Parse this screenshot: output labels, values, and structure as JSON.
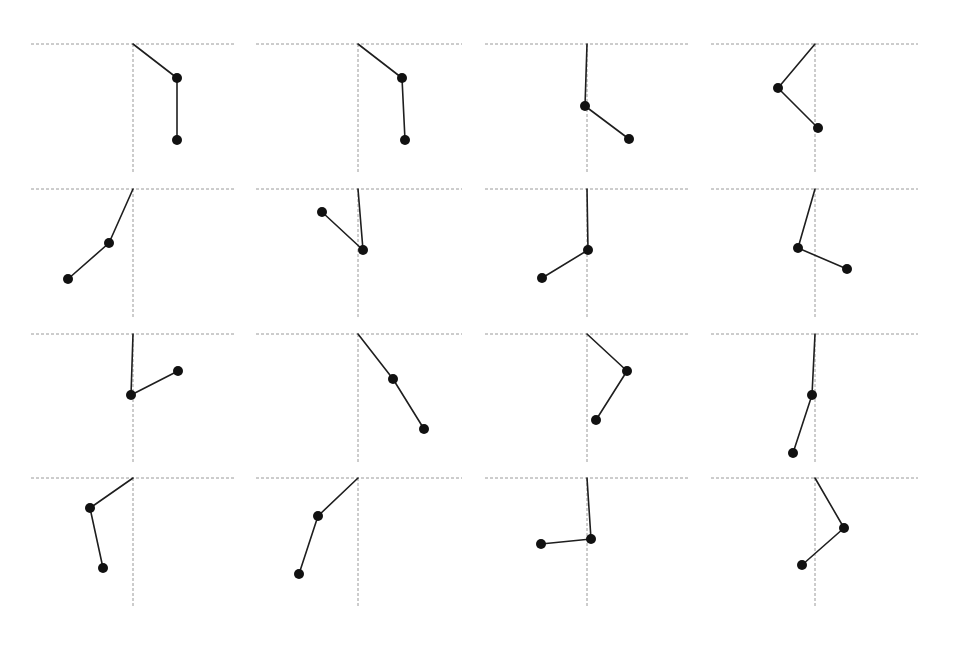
{
  "figure": {
    "rows": 4,
    "columns": 4,
    "colors": {
      "guide": "#9a9a9a",
      "rod": "#1e1e1e",
      "bob": "#111111",
      "background": "#ffffff"
    },
    "bob_radius": 5,
    "guide_vertical_length": 130,
    "panels": [
      {
        "row": 0,
        "col": 0,
        "h_line": [
          31,
          235
        ],
        "pivot": [
          133,
          44
        ],
        "bob1": [
          177,
          78
        ],
        "bob2": [
          177,
          140
        ]
      },
      {
        "row": 0,
        "col": 1,
        "h_line": [
          256,
          462
        ],
        "pivot": [
          358,
          44
        ],
        "bob1": [
          402,
          78
        ],
        "bob2": [
          405,
          140
        ]
      },
      {
        "row": 0,
        "col": 2,
        "h_line": [
          485,
          690
        ],
        "pivot": [
          587,
          44
        ],
        "bob1": [
          585,
          106
        ],
        "bob2": [
          629,
          139
        ]
      },
      {
        "row": 0,
        "col": 3,
        "h_line": [
          711,
          918
        ],
        "pivot": [
          815,
          44
        ],
        "bob1": [
          778,
          88
        ],
        "bob2": [
          818,
          128
        ]
      },
      {
        "row": 1,
        "col": 0,
        "h_line": [
          31,
          235
        ],
        "pivot": [
          133,
          189
        ],
        "bob1": [
          109,
          243
        ],
        "bob2": [
          68,
          279
        ]
      },
      {
        "row": 1,
        "col": 1,
        "h_line": [
          256,
          462
        ],
        "pivot": [
          358,
          189
        ],
        "bob1": [
          363,
          250
        ],
        "bob2": [
          322,
          212
        ]
      },
      {
        "row": 1,
        "col": 2,
        "h_line": [
          485,
          690
        ],
        "pivot": [
          587,
          189
        ],
        "bob1": [
          588,
          250
        ],
        "bob2": [
          542,
          278
        ]
      },
      {
        "row": 1,
        "col": 3,
        "h_line": [
          711,
          918
        ],
        "pivot": [
          815,
          189
        ],
        "bob1": [
          798,
          248
        ],
        "bob2": [
          847,
          269
        ]
      },
      {
        "row": 2,
        "col": 0,
        "h_line": [
          31,
          235
        ],
        "pivot": [
          133,
          334
        ],
        "bob1": [
          131,
          395
        ],
        "bob2": [
          178,
          371
        ]
      },
      {
        "row": 2,
        "col": 1,
        "h_line": [
          256,
          462
        ],
        "pivot": [
          358,
          334
        ],
        "bob1": [
          393,
          379
        ],
        "bob2": [
          424,
          429
        ]
      },
      {
        "row": 2,
        "col": 2,
        "h_line": [
          485,
          690
        ],
        "pivot": [
          587,
          334
        ],
        "bob1": [
          627,
          371
        ],
        "bob2": [
          596,
          420
        ]
      },
      {
        "row": 2,
        "col": 3,
        "h_line": [
          711,
          918
        ],
        "pivot": [
          815,
          334
        ],
        "bob1": [
          812,
          395
        ],
        "bob2": [
          793,
          453
        ]
      },
      {
        "row": 3,
        "col": 0,
        "h_line": [
          31,
          235
        ],
        "pivot": [
          133,
          478
        ],
        "bob1": [
          90,
          508
        ],
        "bob2": [
          103,
          568
        ]
      },
      {
        "row": 3,
        "col": 1,
        "h_line": [
          256,
          462
        ],
        "pivot": [
          358,
          478
        ],
        "bob1": [
          318,
          516
        ],
        "bob2": [
          299,
          574
        ]
      },
      {
        "row": 3,
        "col": 2,
        "h_line": [
          485,
          690
        ],
        "pivot": [
          587,
          478
        ],
        "bob1": [
          591,
          539
        ],
        "bob2": [
          541,
          544
        ]
      },
      {
        "row": 3,
        "col": 3,
        "h_line": [
          711,
          918
        ],
        "pivot": [
          815,
          478
        ],
        "bob1": [
          844,
          528
        ],
        "bob2": [
          802,
          565
        ]
      }
    ]
  }
}
